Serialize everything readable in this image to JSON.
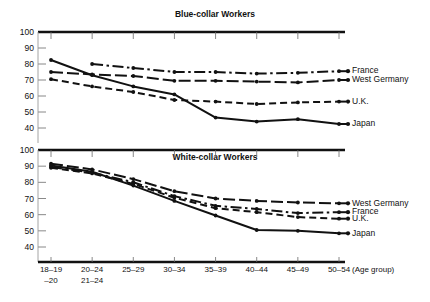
{
  "figure": {
    "xlabel_note": "(Age group)",
    "categories": [
      "18–19\n–20",
      "20–24\n21–24",
      "25–29",
      "30–34",
      "35–39",
      "40–44",
      "45–49",
      "50–54"
    ],
    "categories_line1": [
      "18–19",
      "20–24",
      "25–29",
      "30–34",
      "35–39",
      "40–44",
      "45–49",
      "50–54"
    ],
    "categories_line2": [
      "–20",
      "21–24",
      "",
      "",
      "",
      "",
      "",
      ""
    ],
    "yticks": [
      100,
      90,
      80,
      70,
      60,
      50,
      40
    ]
  },
  "chart_data": [
    {
      "type": "line",
      "title": "Blue-collar Workers",
      "xlabel": "(Age group)",
      "ylabel": "",
      "ylim": [
        35,
        100
      ],
      "yticks": [
        100,
        90,
        80,
        70,
        60,
        50,
        40
      ],
      "grid": true,
      "legend_position": "right-of-axes",
      "categories": [
        "18–19 –20",
        "20–24 21–24",
        "25–29",
        "30–34",
        "35–39",
        "40–44",
        "45–49",
        "50–54"
      ],
      "series": [
        {
          "name": "France",
          "linestyle": "dashdot",
          "values": [
            null,
            80.0,
            77.5,
            75.0,
            75.0,
            74.0,
            74.5,
            75.5
          ]
        },
        {
          "name": "West Germany",
          "linestyle": "longdash",
          "values": [
            75.0,
            73.5,
            72.5,
            69.5,
            69.5,
            69.0,
            68.5,
            70.0
          ]
        },
        {
          "name": "U.K.",
          "linestyle": "dash",
          "values": [
            70.5,
            66.0,
            62.5,
            57.5,
            56.5,
            55.0,
            56.0,
            56.5
          ]
        },
        {
          "name": "Japan",
          "linestyle": "solid",
          "values": [
            82.5,
            73.0,
            66.0,
            61.0,
            46.5,
            44.0,
            45.5,
            42.5
          ]
        }
      ]
    },
    {
      "type": "line",
      "title": "White-collar Workers",
      "xlabel": "(Age group)",
      "ylabel": "",
      "ylim": [
        35,
        100
      ],
      "yticks": [
        100,
        90,
        80,
        70,
        60,
        50,
        40
      ],
      "grid": true,
      "legend_position": "right-of-axes",
      "categories": [
        "18–19 –20",
        "20–24 21–24",
        "25–29",
        "30–34",
        "35–39",
        "40–44",
        "45–49",
        "50–54"
      ],
      "series": [
        {
          "name": "West Germany",
          "linestyle": "longdash",
          "values": [
            91.5,
            88.0,
            82.0,
            74.5,
            70.0,
            68.5,
            67.5,
            67.0
          ]
        },
        {
          "name": "France",
          "linestyle": "dashdot",
          "values": [
            89.5,
            86.0,
            80.0,
            71.5,
            65.5,
            63.5,
            61.0,
            61.5
          ]
        },
        {
          "name": "U.K.",
          "linestyle": "dash",
          "values": [
            89.0,
            85.5,
            79.0,
            70.5,
            64.0,
            61.5,
            58.5,
            57.5
          ]
        },
        {
          "name": "Japan",
          "linestyle": "solid",
          "values": [
            90.5,
            86.5,
            78.0,
            68.5,
            59.5,
            50.5,
            50.0,
            48.5
          ]
        }
      ]
    }
  ],
  "legends": {
    "top": [
      "France",
      "West Germany",
      "U.K.",
      "Japan"
    ],
    "bottom": [
      "West Germany",
      "France",
      "U.K.",
      "Japan"
    ]
  }
}
